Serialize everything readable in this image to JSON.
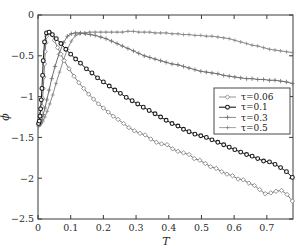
{
  "chart_data": {
    "type": "line",
    "title": "",
    "xlabel": "T",
    "ylabel": "ϕ",
    "xlim": [
      0,
      0.78
    ],
    "ylim": [
      -2.5,
      0
    ],
    "xticks": [
      0,
      0.1,
      0.2,
      0.3,
      0.4,
      0.5,
      0.6,
      0.7
    ],
    "xticklabels": [
      "0",
      "0.1",
      "0.2",
      "0.3",
      "0.4",
      "0.5",
      "0.6",
      "0.7"
    ],
    "yticks": [
      0,
      -0.5,
      -1,
      -1.5,
      -2,
      -2.5
    ],
    "yticklabels": [
      "0",
      "−0.5",
      "−1",
      "−1.5",
      "−2",
      "−2.5"
    ],
    "grid": false,
    "legend_position": "center-right",
    "series": [
      {
        "name": "τ = 0.06",
        "label": "τ=0.06",
        "marker": "diamond",
        "color": "#7a7a7a",
        "x": [
          0.002,
          0.004,
          0.006,
          0.008,
          0.01,
          0.012,
          0.014,
          0.016,
          0.018,
          0.02,
          0.022,
          0.024,
          0.026,
          0.03,
          0.035,
          0.042,
          0.05,
          0.06,
          0.07,
          0.08,
          0.095,
          0.11,
          0.125,
          0.14,
          0.155,
          0.17,
          0.185,
          0.2,
          0.215,
          0.23,
          0.245,
          0.262,
          0.278,
          0.295,
          0.312,
          0.328,
          0.345,
          0.362,
          0.378,
          0.395,
          0.412,
          0.428,
          0.445,
          0.462,
          0.478,
          0.495,
          0.512,
          0.528,
          0.545,
          0.562,
          0.578,
          0.595,
          0.612,
          0.628,
          0.645,
          0.662,
          0.678,
          0.695,
          0.712,
          0.728,
          0.745,
          0.762,
          0.778
        ],
        "y": [
          -1.34,
          -1.33,
          -1.3,
          -1.26,
          -1.2,
          -1.12,
          -1.02,
          -0.9,
          -0.76,
          -0.6,
          -0.45,
          -0.34,
          -0.26,
          -0.22,
          -0.21,
          -0.24,
          -0.31,
          -0.4,
          -0.48,
          -0.56,
          -0.66,
          -0.75,
          -0.83,
          -0.9,
          -0.97,
          -1.03,
          -1.09,
          -1.14,
          -1.19,
          -1.24,
          -1.28,
          -1.33,
          -1.38,
          -1.42,
          -1.45,
          -1.47,
          -1.52,
          -1.56,
          -1.58,
          -1.59,
          -1.64,
          -1.67,
          -1.69,
          -1.71,
          -1.76,
          -1.78,
          -1.82,
          -1.86,
          -1.88,
          -1.92,
          -1.95,
          -1.97,
          -2.01,
          -2.02,
          -2.06,
          -2.09,
          -2.14,
          -2.19,
          -2.18,
          -2.16,
          -2.15,
          -2.2,
          -2.28
        ]
      },
      {
        "name": "τ = 0.1",
        "label": "τ=0.1",
        "marker": "circle-filled",
        "color": "#1a1a1a",
        "x": [
          0.002,
          0.004,
          0.006,
          0.008,
          0.01,
          0.012,
          0.014,
          0.016,
          0.02,
          0.026,
          0.034,
          0.044,
          0.056,
          0.07,
          0.085,
          0.1,
          0.115,
          0.13,
          0.148,
          0.165,
          0.182,
          0.2,
          0.218,
          0.235,
          0.252,
          0.27,
          0.288,
          0.305,
          0.322,
          0.34,
          0.358,
          0.375,
          0.392,
          0.41,
          0.428,
          0.445,
          0.462,
          0.48,
          0.498,
          0.515,
          0.532,
          0.55,
          0.568,
          0.585,
          0.602,
          0.62,
          0.638,
          0.655,
          0.672,
          0.69,
          0.708,
          0.725,
          0.742,
          0.76,
          0.778
        ],
        "y": [
          -1.33,
          -1.3,
          -1.24,
          -1.15,
          -1.04,
          -0.9,
          -0.74,
          -0.56,
          -0.33,
          -0.22,
          -0.21,
          -0.24,
          -0.29,
          -0.35,
          -0.42,
          -0.48,
          -0.54,
          -0.59,
          -0.66,
          -0.71,
          -0.77,
          -0.82,
          -0.87,
          -0.92,
          -0.96,
          -1.01,
          -1.05,
          -1.09,
          -1.13,
          -1.17,
          -1.21,
          -1.25,
          -1.29,
          -1.33,
          -1.36,
          -1.4,
          -1.43,
          -1.46,
          -1.48,
          -1.5,
          -1.53,
          -1.56,
          -1.59,
          -1.62,
          -1.65,
          -1.68,
          -1.71,
          -1.73,
          -1.76,
          -1.79,
          -1.8,
          -1.83,
          -1.87,
          -1.92,
          -1.99
        ]
      },
      {
        "name": "τ = 0.3",
        "label": "τ=0.3",
        "marker": "plus",
        "color": "#6e6e6e",
        "x": [
          0.002,
          0.005,
          0.008,
          0.012,
          0.016,
          0.021,
          0.027,
          0.034,
          0.042,
          0.052,
          0.064,
          0.078,
          0.09,
          0.102,
          0.115,
          0.13,
          0.145,
          0.16,
          0.175,
          0.192,
          0.208,
          0.225,
          0.242,
          0.258,
          0.275,
          0.292,
          0.308,
          0.325,
          0.342,
          0.358,
          0.375,
          0.392,
          0.41,
          0.428,
          0.445,
          0.462,
          0.48,
          0.498,
          0.515,
          0.532,
          0.55,
          0.568,
          0.585,
          0.602,
          0.62,
          0.638,
          0.655,
          0.672,
          0.69,
          0.708,
          0.725,
          0.742,
          0.76,
          0.778
        ],
        "y": [
          -1.36,
          -1.34,
          -1.32,
          -1.28,
          -1.22,
          -1.14,
          -1.04,
          -0.92,
          -0.78,
          -0.63,
          -0.48,
          -0.34,
          -0.26,
          -0.23,
          -0.22,
          -0.22,
          -0.23,
          -0.24,
          -0.25,
          -0.27,
          -0.29,
          -0.32,
          -0.35,
          -0.38,
          -0.41,
          -0.44,
          -0.47,
          -0.5,
          -0.52,
          -0.54,
          -0.56,
          -0.58,
          -0.6,
          -0.61,
          -0.63,
          -0.65,
          -0.67,
          -0.69,
          -0.7,
          -0.71,
          -0.72,
          -0.74,
          -0.75,
          -0.76,
          -0.77,
          -0.78,
          -0.78,
          -0.79,
          -0.79,
          -0.8,
          -0.8,
          -0.81,
          -0.82,
          -0.84
        ]
      },
      {
        "name": "τ = 0.5",
        "label": "τ=0.5",
        "marker": "plus-small",
        "color": "#8a8a8a",
        "x": [
          0.002,
          0.006,
          0.01,
          0.015,
          0.021,
          0.028,
          0.036,
          0.045,
          0.055,
          0.066,
          0.078,
          0.09,
          0.102,
          0.115,
          0.128,
          0.142,
          0.158,
          0.175,
          0.192,
          0.208,
          0.225,
          0.242,
          0.258,
          0.275,
          0.292,
          0.308,
          0.325,
          0.342,
          0.358,
          0.375,
          0.392,
          0.41,
          0.428,
          0.445,
          0.462,
          0.48,
          0.498,
          0.515,
          0.532,
          0.55,
          0.568,
          0.585,
          0.602,
          0.62,
          0.638,
          0.655,
          0.672,
          0.69,
          0.708,
          0.725,
          0.742,
          0.76,
          0.778
        ],
        "y": [
          -1.36,
          -1.35,
          -1.33,
          -1.3,
          -1.25,
          -1.18,
          -1.09,
          -0.98,
          -0.84,
          -0.7,
          -0.55,
          -0.42,
          -0.32,
          -0.25,
          -0.23,
          -0.22,
          -0.21,
          -0.21,
          -0.21,
          -0.21,
          -0.21,
          -0.21,
          -0.21,
          -0.2,
          -0.2,
          -0.21,
          -0.21,
          -0.21,
          -0.22,
          -0.22,
          -0.22,
          -0.23,
          -0.23,
          -0.24,
          -0.24,
          -0.25,
          -0.25,
          -0.26,
          -0.26,
          -0.27,
          -0.28,
          -0.29,
          -0.31,
          -0.33,
          -0.35,
          -0.37,
          -0.38,
          -0.4,
          -0.42,
          -0.43,
          -0.44,
          -0.45,
          -0.46
        ]
      }
    ]
  }
}
